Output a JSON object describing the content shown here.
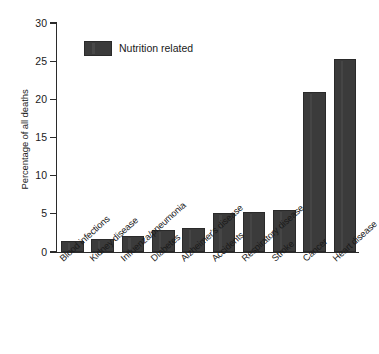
{
  "chart_data": {
    "type": "bar",
    "title": "",
    "xlabel": "",
    "ylabel": "Percentage of all deaths",
    "ylim": [
      0,
      30
    ],
    "yticks": [
      0,
      5,
      10,
      15,
      20,
      25,
      30
    ],
    "ytick_labels": [
      "0",
      "5",
      "10",
      "15",
      "20",
      "25",
      "30"
    ],
    "grid": false,
    "legend": {
      "position": "top-left-inside",
      "entries": [
        {
          "label": "Nutrition related",
          "color": "#3b3b3b"
        }
      ]
    },
    "categories": [
      "Blood infections",
      "Kidney disease",
      "Influenza/pneumonia",
      "Diabetes",
      "Alzheimer's disease",
      "Accidents",
      "Respiratory disease",
      "Stroke",
      "Cancer",
      "Heart disease"
    ],
    "values": [
      1.4,
      1.7,
      2.1,
      2.9,
      3.1,
      5.1,
      5.2,
      5.5,
      21.0,
      25.3
    ],
    "series": [
      {
        "name": "Nutrition related",
        "values": [
          1.4,
          1.7,
          2.1,
          2.9,
          3.1,
          5.1,
          5.2,
          5.5,
          21.0,
          25.3
        ]
      }
    ],
    "bar_color": "#3b3b3b",
    "axis_color": "#2b2b2b",
    "background": "#ffffff"
  }
}
